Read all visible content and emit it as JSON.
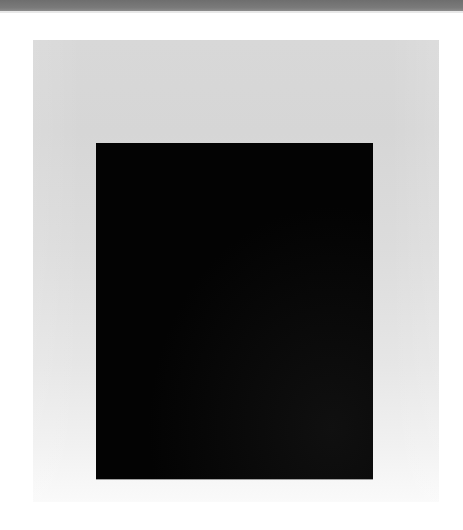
{
  "scene": {
    "description": "Black rectangular panel photographed against a light gray backdrop that fades to white toward the bottom, with a dark gray strip along the top edge",
    "colors": {
      "top_strip": "#767676",
      "backdrop": "#d8d8d8",
      "backdrop_fade": "#fafafa",
      "panel": "#030303",
      "page": "#ffffff"
    }
  }
}
